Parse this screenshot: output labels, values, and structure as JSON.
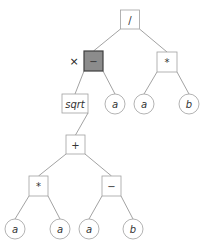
{
  "diagram": {
    "type": "expression-tree",
    "nodes": [
      {
        "id": "div",
        "label": "/",
        "shape": "box",
        "x": 130,
        "y": 19.5,
        "w": 19,
        "h": 19,
        "italic": false,
        "highlight": false
      },
      {
        "id": "sub1",
        "label": "−",
        "shape": "box",
        "x": 93.5,
        "y": 61,
        "w": 19,
        "h": 20,
        "italic": false,
        "highlight": true
      },
      {
        "id": "mul1",
        "label": "*",
        "shape": "box",
        "x": 167,
        "y": 62,
        "w": 20,
        "h": 20,
        "italic": false,
        "highlight": false
      },
      {
        "id": "sqrt",
        "label": "sqrt",
        "shape": "box",
        "x": 75,
        "y": 103.5,
        "w": 26,
        "h": 19,
        "italic": true,
        "highlight": false
      },
      {
        "id": "a1",
        "label": "a",
        "shape": "circle",
        "x": 115,
        "y": 104,
        "r": 10,
        "italic": true
      },
      {
        "id": "a2",
        "label": "a",
        "shape": "circle",
        "x": 144,
        "y": 104,
        "r": 10,
        "italic": true
      },
      {
        "id": "b1",
        "label": "b",
        "shape": "circle",
        "x": 189,
        "y": 104,
        "r": 10,
        "italic": true
      },
      {
        "id": "add",
        "label": "+",
        "shape": "box",
        "x": 75.5,
        "y": 144.5,
        "w": 19,
        "h": 19,
        "italic": false,
        "highlight": false
      },
      {
        "id": "mul2",
        "label": "*",
        "shape": "box",
        "x": 38.5,
        "y": 186,
        "w": 19,
        "h": 20,
        "italic": false,
        "highlight": false
      },
      {
        "id": "sub2",
        "label": "−",
        "shape": "box",
        "x": 111.5,
        "y": 186,
        "w": 19,
        "h": 20,
        "italic": false,
        "highlight": false
      },
      {
        "id": "a3",
        "label": "a",
        "shape": "circle",
        "x": 15,
        "y": 229,
        "r": 10,
        "italic": true
      },
      {
        "id": "a4",
        "label": "a",
        "shape": "circle",
        "x": 60,
        "y": 229,
        "r": 10,
        "italic": true
      },
      {
        "id": "a5",
        "label": "a",
        "shape": "circle",
        "x": 89,
        "y": 229,
        "r": 10,
        "italic": true
      },
      {
        "id": "b2",
        "label": "b",
        "shape": "circle",
        "x": 133,
        "y": 229,
        "r": 10,
        "italic": true
      }
    ],
    "edges": [
      [
        "div",
        "sub1"
      ],
      [
        "div",
        "mul1"
      ],
      [
        "sub1",
        "sqrt"
      ],
      [
        "sub1",
        "a1"
      ],
      [
        "mul1",
        "a2"
      ],
      [
        "mul1",
        "b1"
      ],
      [
        "sqrt",
        "add"
      ],
      [
        "add",
        "mul2"
      ],
      [
        "add",
        "sub2"
      ],
      [
        "mul2",
        "a3"
      ],
      [
        "mul2",
        "a4"
      ],
      [
        "sub2",
        "a5"
      ],
      [
        "sub2",
        "b2"
      ]
    ],
    "marker": {
      "label": "×",
      "x": 74,
      "y": 61,
      "target": "sub1"
    },
    "colors": {
      "highlight_fill": "#8c8c8c",
      "highlight_stroke": "#3e3e3e",
      "node_stroke": "#a0a0a0",
      "edge": "#8a8a8a"
    }
  }
}
